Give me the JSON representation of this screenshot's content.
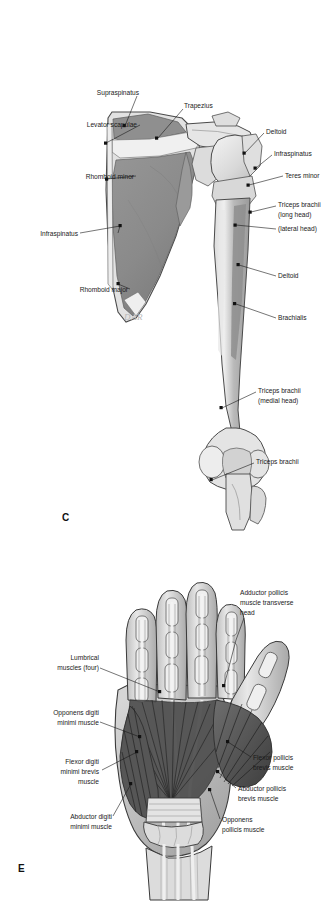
{
  "page": {
    "background_color": "#ffffff",
    "width": 334,
    "height": 905,
    "content_type": "anatomical-illustration-plate"
  },
  "palette": {
    "bone_light": "#e9e9e9",
    "bone_mid": "#cfcfcf",
    "muscle_grey": "#8d8d8d",
    "muscle_grey_dark": "#6f6f6f",
    "muscle_dark": "#4a4a4a",
    "outline": "#3a3a3a",
    "label_text": "#1a1a1a",
    "leader_line": "#1a1a1a",
    "signature": "#b8b8b8"
  },
  "figure_c": {
    "panel_letter": "C",
    "signature": "DAR",
    "view": "posterior view of scapula and humerus with muscle attachment sites",
    "labels_left": [
      {
        "text": "Levator scapulae",
        "x": 92,
        "y": 127,
        "dot_x": 105,
        "dot_y": 143
      },
      {
        "text": "Rhomboid minor",
        "x": 82,
        "y": 178,
        "dot_x": 107,
        "dot_y": 179
      },
      {
        "text": "Infraspinatus",
        "x": 76,
        "y": 235,
        "dot_x": 120,
        "dot_y": 225
      },
      {
        "text": "Rhomboid major",
        "x": 86,
        "y": 291,
        "dot_x": 118,
        "dot_y": 283
      }
    ],
    "labels_top": [
      {
        "text": "Supraspinatus",
        "x": 139,
        "y": 93,
        "dot_x": 125,
        "dot_y": 127
      },
      {
        "text": "Trapezius",
        "x": 182,
        "y": 106,
        "dot_x": 157,
        "dot_y": 139
      }
    ],
    "labels_right": [
      {
        "text": "Deltoid",
        "x": 266,
        "y": 131,
        "dot_x": 244,
        "dot_y": 153
      },
      {
        "text": "Infraspinatus",
        "x": 274,
        "y": 153,
        "dot_x": 255,
        "dot_y": 168
      },
      {
        "text": "Teres minor",
        "x": 285,
        "y": 178,
        "dot_x": 248,
        "dot_y": 185
      },
      {
        "text": "Triceps brachii",
        "x": 278,
        "y": 205,
        "dot_x": 250,
        "dot_y": 212
      },
      {
        "text": "(long head)",
        "x": 278,
        "y": 215,
        "dot_x": null,
        "dot_y": null
      },
      {
        "text": "(lateral head)",
        "x": 278,
        "y": 231,
        "dot_x": 234,
        "dot_y": 225
      },
      {
        "text": "Deltoid",
        "x": 278,
        "y": 278,
        "dot_x": 238,
        "dot_y": 264
      },
      {
        "text": "Brachialis",
        "x": 278,
        "y": 320,
        "dot_x": 234,
        "dot_y": 303
      },
      {
        "text": "Triceps brachii",
        "x": 258,
        "y": 391,
        "dot_x": 221,
        "dot_y": 407
      },
      {
        "text": "(medial head)",
        "x": 258,
        "y": 401,
        "dot_x": null,
        "dot_y": null
      },
      {
        "text": "Triceps brachii",
        "x": 256,
        "y": 462,
        "dot_x": 211,
        "dot_y": 479
      }
    ]
  },
  "figure_e": {
    "panel_letter": "E",
    "view": "palmar view of the hand with intrinsic muscles",
    "labels_right": [
      {
        "text": "Adductor pollicis",
        "x": 240,
        "y": 593,
        "dot_x": 224,
        "dot_y": 686
      },
      {
        "text": "muscle transverse",
        "x": 240,
        "y": 603,
        "dot_x": null,
        "dot_y": null
      },
      {
        "text": "head",
        "x": 240,
        "y": 613,
        "dot_x": null,
        "dot_y": null
      },
      {
        "text": "Flexor pollicis",
        "x": 253,
        "y": 760,
        "dot_x": 228,
        "dot_y": 742
      },
      {
        "text": "brevis muscle",
        "x": 253,
        "y": 770,
        "dot_x": null,
        "dot_y": null
      },
      {
        "text": "Abductor pollicis",
        "x": 238,
        "y": 791,
        "dot_x": 218,
        "dot_y": 772
      },
      {
        "text": "brevis muscle",
        "x": 238,
        "y": 801,
        "dot_x": null,
        "dot_y": null
      },
      {
        "text": "Opponens",
        "x": 222,
        "y": 822,
        "dot_x": 210,
        "dot_y": 789
      },
      {
        "text": "pollicis muscle",
        "x": 222,
        "y": 832,
        "dot_x": null,
        "dot_y": null
      }
    ],
    "labels_left": [
      {
        "text": "Lumbrical",
        "x": 97,
        "y": 658,
        "dot_x": 160,
        "dot_y": 692
      },
      {
        "text": "muscles (four)",
        "x": 97,
        "y": 668,
        "dot_x": null,
        "dot_y": null
      },
      {
        "text": "Opponens digiti",
        "x": 97,
        "y": 714,
        "dot_x": 140,
        "dot_y": 737
      },
      {
        "text": "minimi muscle",
        "x": 97,
        "y": 724,
        "dot_x": null,
        "dot_y": null
      },
      {
        "text": "Flexor digiti",
        "x": 97,
        "y": 763,
        "dot_x": 137,
        "dot_y": 752
      },
      {
        "text": "minimi brevis",
        "x": 97,
        "y": 773,
        "dot_x": null,
        "dot_y": null
      },
      {
        "text": "muscle",
        "x": 97,
        "y": 783,
        "dot_x": null,
        "dot_y": null
      },
      {
        "text": "Abductor digiti",
        "x": 110,
        "y": 818,
        "dot_x": 131,
        "dot_y": 784
      },
      {
        "text": "minimi muscle",
        "x": 110,
        "y": 828,
        "dot_x": null,
        "dot_y": null
      }
    ]
  }
}
